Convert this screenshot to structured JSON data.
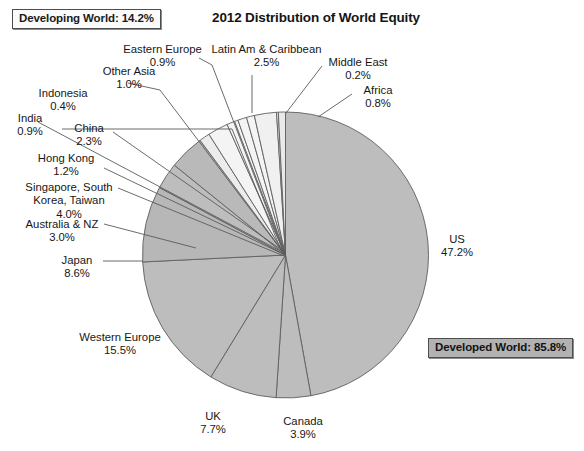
{
  "title": "2012 Distribution of World Equity",
  "groups": {
    "developing": {
      "label": "Developing World:  14.2%",
      "color": "#f2f2f2"
    },
    "developed": {
      "label": "Developed World:  85.8%",
      "color": "#b2b2b2"
    }
  },
  "chart_data": {
    "type": "pie",
    "title": "2012 Distribution of World Equity",
    "unit": "%",
    "total": 100.0,
    "start_angle_deg": 0,
    "direction": "clockwise",
    "legend": "none",
    "grid": false,
    "annotations": [
      "Developing World:  14.2%",
      "Developed World:  85.8%"
    ],
    "categories": [
      "US",
      "Canada",
      "UK",
      "Western Europe",
      "Japan",
      "Australia & NZ",
      "Singapore, South Korea, Taiwan",
      "Hong Kong",
      "China",
      "India",
      "Indonesia",
      "Other Asia",
      "Eastern Europe",
      "Latin Am & Caribbean",
      "Middle East",
      "Africa"
    ],
    "values": [
      47.2,
      3.9,
      7.7,
      15.5,
      8.6,
      3.0,
      4.0,
      1.2,
      2.3,
      0.9,
      0.4,
      1.0,
      0.9,
      2.5,
      0.2,
      0.8
    ],
    "slices": [
      {
        "name": "US",
        "value": 47.2,
        "label": "US",
        "pct": "47.2%",
        "group": "developed",
        "color": "#bdbdbd"
      },
      {
        "name": "Canada",
        "value": 3.9,
        "label": "Canada",
        "pct": "3.9%",
        "group": "developed",
        "color": "#bdbdbd"
      },
      {
        "name": "UK",
        "value": 7.7,
        "label": "UK",
        "pct": "7.7%",
        "group": "developed",
        "color": "#bdbdbd"
      },
      {
        "name": "Western Europe",
        "value": 15.5,
        "label": "Western Europe",
        "pct": "15.5%",
        "group": "developed",
        "color": "#bdbdbd"
      },
      {
        "name": "Japan",
        "value": 8.6,
        "label": "Japan",
        "pct": "8.6%",
        "group": "developed",
        "color": "#b7b7b7"
      },
      {
        "name": "Australia & NZ",
        "value": 3.0,
        "label": "Australia & NZ",
        "pct": "3.0%",
        "group": "developed",
        "color": "#bdbdbd"
      },
      {
        "name": "Singapore, South Korea, Taiwan",
        "value": 4.0,
        "label": "Singapore, South Korea, Taiwan",
        "pct": "4.0%",
        "group": "developed",
        "color": "#b9b9b9"
      },
      {
        "name": "Hong Kong",
        "value": 1.2,
        "label": "Hong Kong",
        "pct": "1.2%",
        "group": "developing",
        "color": "#ececec"
      },
      {
        "name": "China",
        "value": 2.3,
        "label": "China",
        "pct": "2.3%",
        "group": "developing",
        "color": "#f4f4f4"
      },
      {
        "name": "India",
        "value": 0.9,
        "label": "India",
        "pct": "0.9%",
        "group": "developing",
        "color": "#f4f4f4"
      },
      {
        "name": "Indonesia",
        "value": 0.4,
        "label": "Indonesia",
        "pct": "0.4%",
        "group": "developing",
        "color": "#f4f4f4"
      },
      {
        "name": "Other Asia",
        "value": 1.0,
        "label": "Other Asia",
        "pct": "1.0%",
        "group": "developing",
        "color": "#f4f4f4"
      },
      {
        "name": "Eastern Europe",
        "value": 0.9,
        "label": "Eastern Europe",
        "pct": "0.9%",
        "group": "developing",
        "color": "#f4f4f4"
      },
      {
        "name": "Latin Am & Caribbean",
        "value": 2.5,
        "label": "Latin Am & Caribbean",
        "pct": "2.5%",
        "group": "developing",
        "color": "#f0f0f0"
      },
      {
        "name": "Middle East",
        "value": 0.2,
        "label": "Middle East",
        "pct": "0.2%",
        "group": "developing",
        "color": "#f4f4f4"
      },
      {
        "name": "Africa",
        "value": 0.8,
        "label": "Africa",
        "pct": "0.8%",
        "group": "developing",
        "color": "#e9e9e9"
      }
    ]
  },
  "labels": {
    "us": {
      "name": "US",
      "pct": "47.2%"
    },
    "canada": {
      "name": "Canada",
      "pct": "3.9%"
    },
    "uk": {
      "name": "UK",
      "pct": "7.7%"
    },
    "western_europe": {
      "name": "Western Europe",
      "pct": "15.5%"
    },
    "japan": {
      "name": "Japan",
      "pct": "8.6%"
    },
    "australia_nz": {
      "name": "Australia & NZ",
      "pct": "3.0%"
    },
    "sskt": {
      "name1": "Singapore, South",
      "name2": "Korea, Taiwan",
      "pct": "4.0%"
    },
    "hong_kong": {
      "name": "Hong Kong",
      "pct": "1.2%"
    },
    "china": {
      "name": "China",
      "pct": "2.3%"
    },
    "india": {
      "name": "India",
      "pct": "0.9%"
    },
    "indonesia": {
      "name": "Indonesia",
      "pct": "0.4%"
    },
    "other_asia": {
      "name": "Other Asia",
      "pct": "1.0%"
    },
    "eastern_europe": {
      "name": "Eastern Europe",
      "pct": "0.9%"
    },
    "latin_am": {
      "name": "Latin Am & Caribbean",
      "pct": "2.5%"
    },
    "middle_east": {
      "name": "Middle East",
      "pct": "0.2%"
    },
    "africa": {
      "name": "Africa",
      "pct": "0.8%"
    }
  }
}
